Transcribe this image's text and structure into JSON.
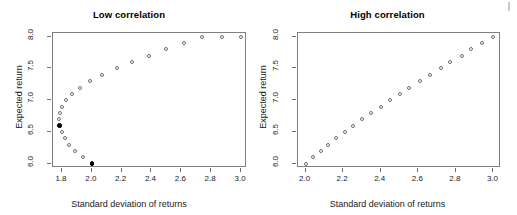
{
  "figure": {
    "background": "#ffffff",
    "marker_stroke": "#6e6e6e",
    "marker_fill_highlight": "#000000",
    "frame_color": "#808080"
  },
  "chart_data": [
    {
      "type": "scatter",
      "title": "Low correlation",
      "xlabel": "Standard deviation of returns",
      "ylabel": "Expected return",
      "xlim": [
        1.74,
        3.04
      ],
      "ylim": [
        5.93,
        8.06
      ],
      "xticks": [
        "1.8",
        "2.0",
        "2.2",
        "2.4",
        "2.6",
        "2.8",
        "3.0"
      ],
      "xtick_values": [
        1.8,
        2.0,
        2.2,
        2.4,
        2.6,
        2.8,
        3.0
      ],
      "yticks": [
        "6.0",
        "6.5",
        "7.0",
        "7.5",
        "8.0"
      ],
      "ytick_values": [
        6.0,
        6.5,
        7.0,
        7.5,
        8.0
      ],
      "grid": false,
      "legend": "none",
      "series": [
        {
          "name": "frontier",
          "marker": "open-circle",
          "x": [
            2.0,
            1.94,
            1.89,
            1.85,
            1.82,
            1.8,
            1.785,
            1.78,
            1.785,
            1.8,
            1.83,
            1.87,
            1.92,
            1.99,
            2.07,
            2.17,
            2.27,
            2.38,
            2.5,
            2.62,
            2.74,
            2.87,
            3.0
          ],
          "y": [
            6.0,
            6.1,
            6.2,
            6.3,
            6.4,
            6.5,
            6.6,
            6.7,
            6.8,
            6.9,
            7.0,
            7.1,
            7.2,
            7.3,
            7.4,
            7.5,
            7.6,
            7.7,
            7.8,
            7.9,
            8.0,
            8.0,
            8.0
          ]
        },
        {
          "name": "highlighted",
          "marker": "filled-circle",
          "x": [
            2.0,
            1.785
          ],
          "y": [
            6.0,
            6.6
          ]
        }
      ]
    },
    {
      "type": "scatter",
      "title": "High correlation",
      "xlabel": "Standard deviation of returns",
      "ylabel": "Expected return",
      "xlim": [
        1.96,
        3.04
      ],
      "ylim": [
        5.93,
        8.06
      ],
      "xticks": [
        "2.0",
        "2.2",
        "2.4",
        "2.6",
        "2.8",
        "3.0"
      ],
      "xtick_values": [
        2.0,
        2.2,
        2.4,
        2.6,
        2.8,
        3.0
      ],
      "yticks": [
        "6.0",
        "6.5",
        "7.0",
        "7.5",
        "8.0"
      ],
      "ytick_values": [
        6.0,
        6.5,
        7.0,
        7.5,
        8.0
      ],
      "grid": false,
      "legend": "none",
      "series": [
        {
          "name": "frontier",
          "marker": "open-circle",
          "x": [
            2.0,
            2.04,
            2.08,
            2.12,
            2.16,
            2.21,
            2.25,
            2.3,
            2.35,
            2.4,
            2.45,
            2.5,
            2.55,
            2.61,
            2.66,
            2.72,
            2.77,
            2.83,
            2.88,
            2.94,
            3.0
          ],
          "y": [
            6.0,
            6.1,
            6.2,
            6.3,
            6.4,
            6.5,
            6.6,
            6.7,
            6.8,
            6.9,
            7.0,
            7.1,
            7.2,
            7.3,
            7.4,
            7.5,
            7.6,
            7.7,
            7.8,
            7.9,
            8.0
          ]
        }
      ]
    }
  ]
}
